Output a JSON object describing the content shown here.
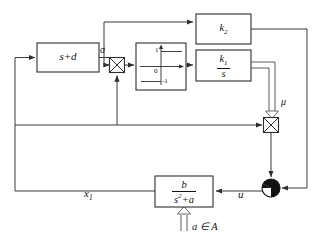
{
  "diagram": {
    "colors": {
      "line": "#3a3a3a",
      "block_stroke": "#2e2e2e",
      "text": "#111111",
      "background": "#ffffff",
      "sum_dark": "#111111"
    },
    "blocks": [
      {
        "id": "lead-filter",
        "name": "s-plus-d-block",
        "label": "s+d",
        "x": 37,
        "y": 43,
        "w": 62,
        "h": 29
      },
      {
        "id": "gain-k2",
        "name": "k2-gain-block",
        "label": "k",
        "subscript": "2",
        "x": 196,
        "y": 14,
        "w": 55,
        "h": 30
      },
      {
        "id": "integrator-k1",
        "name": "k1-over-s-block",
        "numerator": "k",
        "numerator_sub": "1",
        "denominator": "s",
        "x": 196,
        "y": 50,
        "w": 55,
        "h": 31
      },
      {
        "id": "plant",
        "name": "plant-transfer-function-block",
        "numerator": "b",
        "denominator": "s",
        "denominator_sup": "2",
        "denominator_rest": "+a",
        "x": 155,
        "y": 176,
        "w": 58,
        "h": 31
      },
      {
        "id": "relay",
        "name": "signum-nonlinearity-block",
        "x": 136,
        "y": 43,
        "w": 50,
        "h": 47,
        "axis_labels": {
          "upper": "1",
          "origin": "0",
          "lower": "-1"
        }
      }
    ],
    "operators": [
      {
        "id": "mult1",
        "name": "multiplier-node-sigma",
        "type": "multiplier",
        "cx": 117,
        "cy": 65,
        "size": 15
      },
      {
        "id": "mult2",
        "name": "multiplier-node-mu",
        "type": "multiplier",
        "cx": 271,
        "cy": 125,
        "size": 15
      },
      {
        "id": "sum1",
        "name": "summing-junction-u",
        "type": "summing-junction",
        "cx": 271,
        "cy": 188,
        "r": 9
      }
    ],
    "signal_labels": [
      {
        "id": "sigma",
        "name": "sigma-signal-label",
        "text": "σ",
        "x": 100,
        "y": 49
      },
      {
        "id": "mu",
        "name": "mu-signal-label",
        "text": "μ",
        "x": 281,
        "y": 101
      },
      {
        "id": "u",
        "name": "u-signal-label",
        "text": "u",
        "x": 238,
        "y": 193
      },
      {
        "id": "x1",
        "name": "x1-signal-label",
        "text": "x",
        "sub": "1",
        "x": 84,
        "y": 192
      },
      {
        "id": "aina",
        "name": "parameter-set-label",
        "text": "a ∈ A",
        "x": 189,
        "y": 223
      }
    ]
  }
}
